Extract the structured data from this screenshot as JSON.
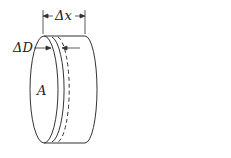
{
  "diagram": {
    "labels": {
      "delta_x": "Δx",
      "delta_d": "ΔD",
      "area": "A"
    },
    "colors": {
      "stroke": "#333333",
      "texture": "#bdbdbd",
      "background": "#ffffff"
    }
  }
}
